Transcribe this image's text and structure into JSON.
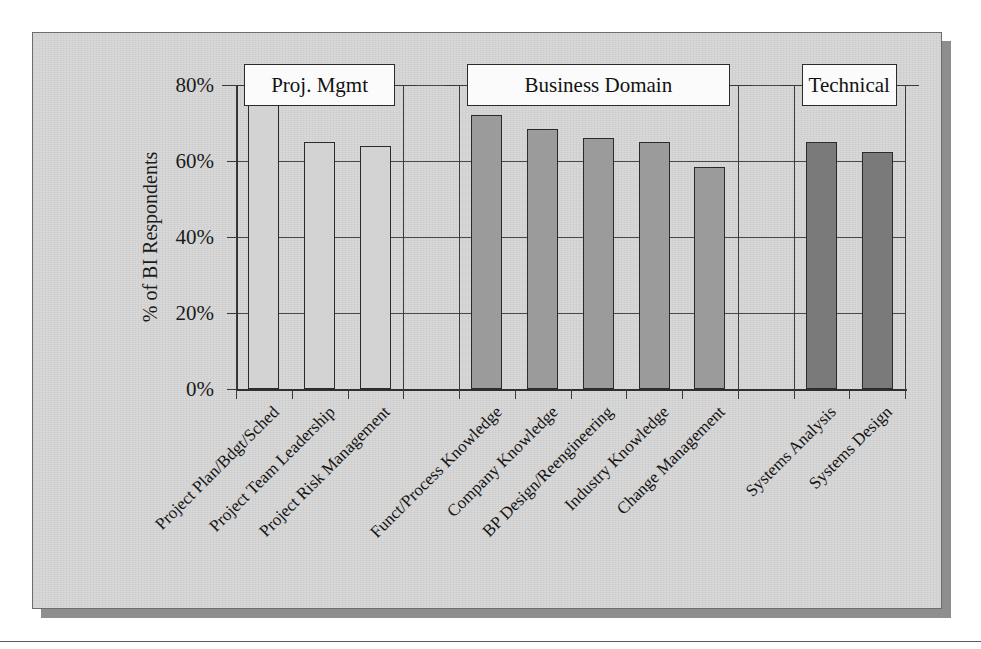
{
  "chart_data": {
    "type": "bar",
    "title": "",
    "xlabel": "",
    "ylabel": "% of BI Respondents",
    "ylim": [
      0,
      80
    ],
    "ytick_labels": [
      "0%",
      "20%",
      "40%",
      "60%",
      "80%"
    ],
    "ytick_values": [
      0,
      20,
      40,
      60,
      80
    ],
    "grid": true,
    "legend_position": "none",
    "categories": [
      "Project Plan/Bdgt/Sched",
      "Project Team Leadership",
      "Project Risk Management",
      "Funct/Process Knowledge",
      "Company Knowledge",
      "BP Design/Reengineering",
      "Industry Knowledge",
      "Change Management",
      "Systems Analysis",
      "Systems Design"
    ],
    "values": [
      75.5,
      65,
      64,
      72,
      68.5,
      66,
      65,
      58.5,
      65,
      62.5
    ],
    "groups": [
      {
        "label": "Proj. Mgmt",
        "indices": [
          0,
          1,
          2
        ],
        "fill": "none"
      },
      {
        "label": "Business Domain",
        "indices": [
          3,
          4,
          5,
          6,
          7
        ],
        "fill": "medium"
      },
      {
        "label": "Technical",
        "indices": [
          8,
          9
        ],
        "fill": "dark"
      }
    ],
    "colors": {
      "fill_none": "#d3d3d3",
      "fill_medium": "#9b9b9b",
      "fill_dark": "#7a7a7a",
      "axis": "#2f2f2f",
      "plot_background": "#d3d3d3",
      "frame_shadow": "#8e8e8e"
    }
  }
}
